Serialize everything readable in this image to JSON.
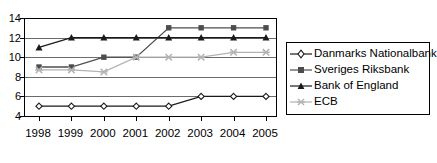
{
  "chart_data": {
    "type": "line",
    "title": "",
    "xlabel": "",
    "ylabel": "",
    "x": [
      "1998",
      "1999",
      "2000",
      "2001",
      "2002",
      "2003",
      "2004",
      "2005"
    ],
    "categories": [
      "1998",
      "1999",
      "2000",
      "2001",
      "2002",
      "2003",
      "2004",
      "2005"
    ],
    "ylim": [
      4,
      14
    ],
    "yticks": [
      4,
      6,
      8,
      10,
      12,
      14
    ],
    "ytick_labels": [
      "4",
      "6",
      "8",
      "10",
      "12",
      "14"
    ],
    "grid": "horizontal",
    "legend_position": "right",
    "series": [
      {
        "name": "Danmarks Nationalbank",
        "marker": "diamond-open",
        "color": "#1a1a1a",
        "values": [
          5,
          5,
          5,
          5,
          5,
          6,
          6,
          6
        ]
      },
      {
        "name": "Sveriges Riksbank",
        "marker": "square-filled",
        "color": "#4d4d4d",
        "values": [
          9,
          9,
          10,
          10,
          13,
          13,
          13,
          13
        ]
      },
      {
        "name": "Bank of England",
        "marker": "triangle-filled",
        "color": "#1a1a1a",
        "values": [
          11,
          12,
          12,
          12,
          12,
          12,
          12,
          12
        ]
      },
      {
        "name": "ECB",
        "marker": "x-cross",
        "color": "#b3b3b3",
        "values": [
          8.7,
          8.7,
          8.5,
          10,
          10,
          10,
          10.5,
          10.5
        ]
      }
    ]
  },
  "legend": {
    "items": [
      {
        "label": "Danmarks Nationalbank",
        "marker": "diamond-open-icon"
      },
      {
        "label": "Sveriges Riksbank",
        "marker": "square-filled-icon"
      },
      {
        "label": "Bank of England",
        "marker": "triangle-filled-icon"
      },
      {
        "label": "ECB",
        "marker": "x-cross-icon"
      }
    ]
  },
  "axis": {
    "y_labels": [
      "14",
      "12",
      "10",
      "8",
      "6",
      "4"
    ],
    "x_labels": [
      "1998",
      "1999",
      "2000",
      "2001",
      "2002",
      "2003",
      "2004",
      "2005"
    ]
  },
  "colors": {
    "axis": "#000000",
    "grid": "#6b6b6b",
    "series_dark": "#1a1a1a",
    "series_mid": "#4d4d4d",
    "series_light": "#b3b3b3",
    "background": "#ffffff"
  }
}
